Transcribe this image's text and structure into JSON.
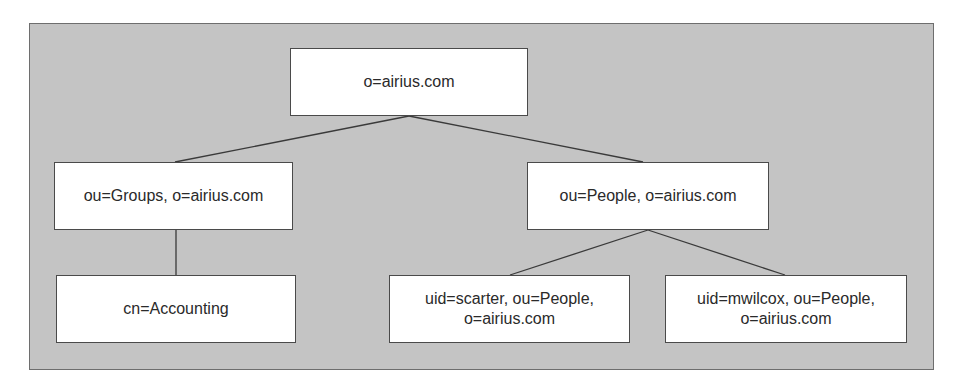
{
  "diagram": {
    "type": "tree",
    "colors": {
      "panel_background": "#c4c4c4",
      "panel_border": "#6e6e6e",
      "node_background": "#ffffff",
      "node_border": "#4a4a4a",
      "connector": "#3a3a3a",
      "text": "#2a2a2a"
    },
    "nodes": {
      "root": {
        "lines": [
          "o=airius.com"
        ],
        "parent": null
      },
      "groups": {
        "lines": [
          "ou=Groups, o=airius.com"
        ],
        "parent": "root"
      },
      "people": {
        "lines": [
          "ou=People, o=airius.com"
        ],
        "parent": "root"
      },
      "accounting": {
        "lines": [
          "cn=Accounting"
        ],
        "parent": "groups"
      },
      "scarter": {
        "lines": [
          "uid=scarter, ou=People,",
          "o=airius.com"
        ],
        "parent": "people"
      },
      "mwilcox": {
        "lines": [
          "uid=mwilcox, ou=People,",
          "o=airius.com"
        ],
        "parent": "people"
      }
    },
    "edges": [
      {
        "from": "root",
        "to": "groups"
      },
      {
        "from": "root",
        "to": "people"
      },
      {
        "from": "groups",
        "to": "accounting"
      },
      {
        "from": "people",
        "to": "scarter"
      },
      {
        "from": "people",
        "to": "mwilcox"
      }
    ]
  }
}
